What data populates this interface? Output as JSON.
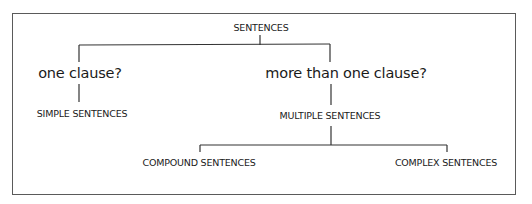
{
  "diagram": {
    "type": "tree",
    "root": {
      "label": "SENTENCES",
      "children": [
        {
          "question": "one clause?",
          "result": "SIMPLE SENTENCES",
          "children": []
        },
        {
          "question": "more than one clause?",
          "result": "MULTIPLE SENTENCES",
          "children": [
            {
              "label": "COMPOUND SENTENCES"
            },
            {
              "label": "COMPLEX SENTENCES"
            }
          ]
        }
      ]
    }
  },
  "labels": {
    "root": "SENTENCES",
    "left_question": "one clause?",
    "right_question": "more than one clause?",
    "simple": "SIMPLE SENTENCES",
    "multiple": "MULTIPLE SENTENCES",
    "compound": "COMPOUND SENTENCES",
    "complex": "COMPLEX SENTENCES"
  },
  "colors": {
    "line": "#333333",
    "frame": "#5a5a5a",
    "text": "#1a1a1a",
    "background": "#ffffff"
  }
}
